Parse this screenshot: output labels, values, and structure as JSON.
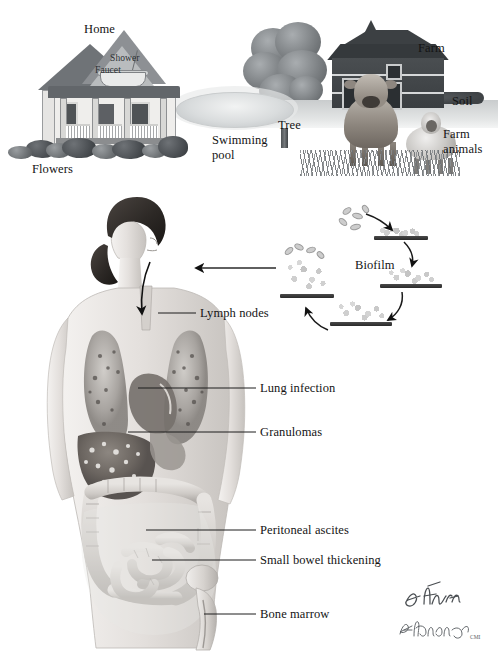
{
  "illustration": {
    "title": "Nontuberculous Mycobacteria: Environmental Sources and Disseminated Disease",
    "artist_signature": "F. Netter",
    "artist_signature_secondary": "B. DeVanzo",
    "artist_signature_suffix": "CMI"
  },
  "environment": {
    "labels": {
      "home": "Home",
      "shower": "Shower",
      "faucet": "Faucet",
      "flowers": "Flowers",
      "swimming_pool": "Swimming\npool",
      "tree": "Tree",
      "farm": "Farm",
      "soil": "Soil",
      "farm_animals": "Farm\nanimals"
    }
  },
  "biofilm": {
    "label": "Biofilm",
    "stages": [
      {
        "name": "attachment",
        "description": "Free-swimming bacilli attach to surface"
      },
      {
        "name": "colonization",
        "description": "Irreversible attachment and microcolony formation"
      },
      {
        "name": "maturation",
        "description": "Extracellular matrix accumulation"
      },
      {
        "name": "dispersion",
        "description": "Bacilli released from mature biofilm"
      }
    ]
  },
  "anatomy": {
    "labels": [
      {
        "id": "lymph-nodes",
        "text": "Lymph nodes"
      },
      {
        "id": "lung-infection",
        "text": "Lung infection"
      },
      {
        "id": "granulomas",
        "text": "Granulomas"
      },
      {
        "id": "peritoneal-ascites",
        "text": "Peritoneal ascites"
      },
      {
        "id": "small-bowel-thickening",
        "text": "Small bowel thickening"
      },
      {
        "id": "bone-marrow",
        "text": "Bone marrow"
      }
    ]
  },
  "colors": {
    "background": "#ffffff",
    "ink": "#141414",
    "leader_line": "#1c1c1c",
    "tone_dark": "#3c4043",
    "tone_mid": "#8d9094",
    "tone_light": "#d9dcdd"
  }
}
